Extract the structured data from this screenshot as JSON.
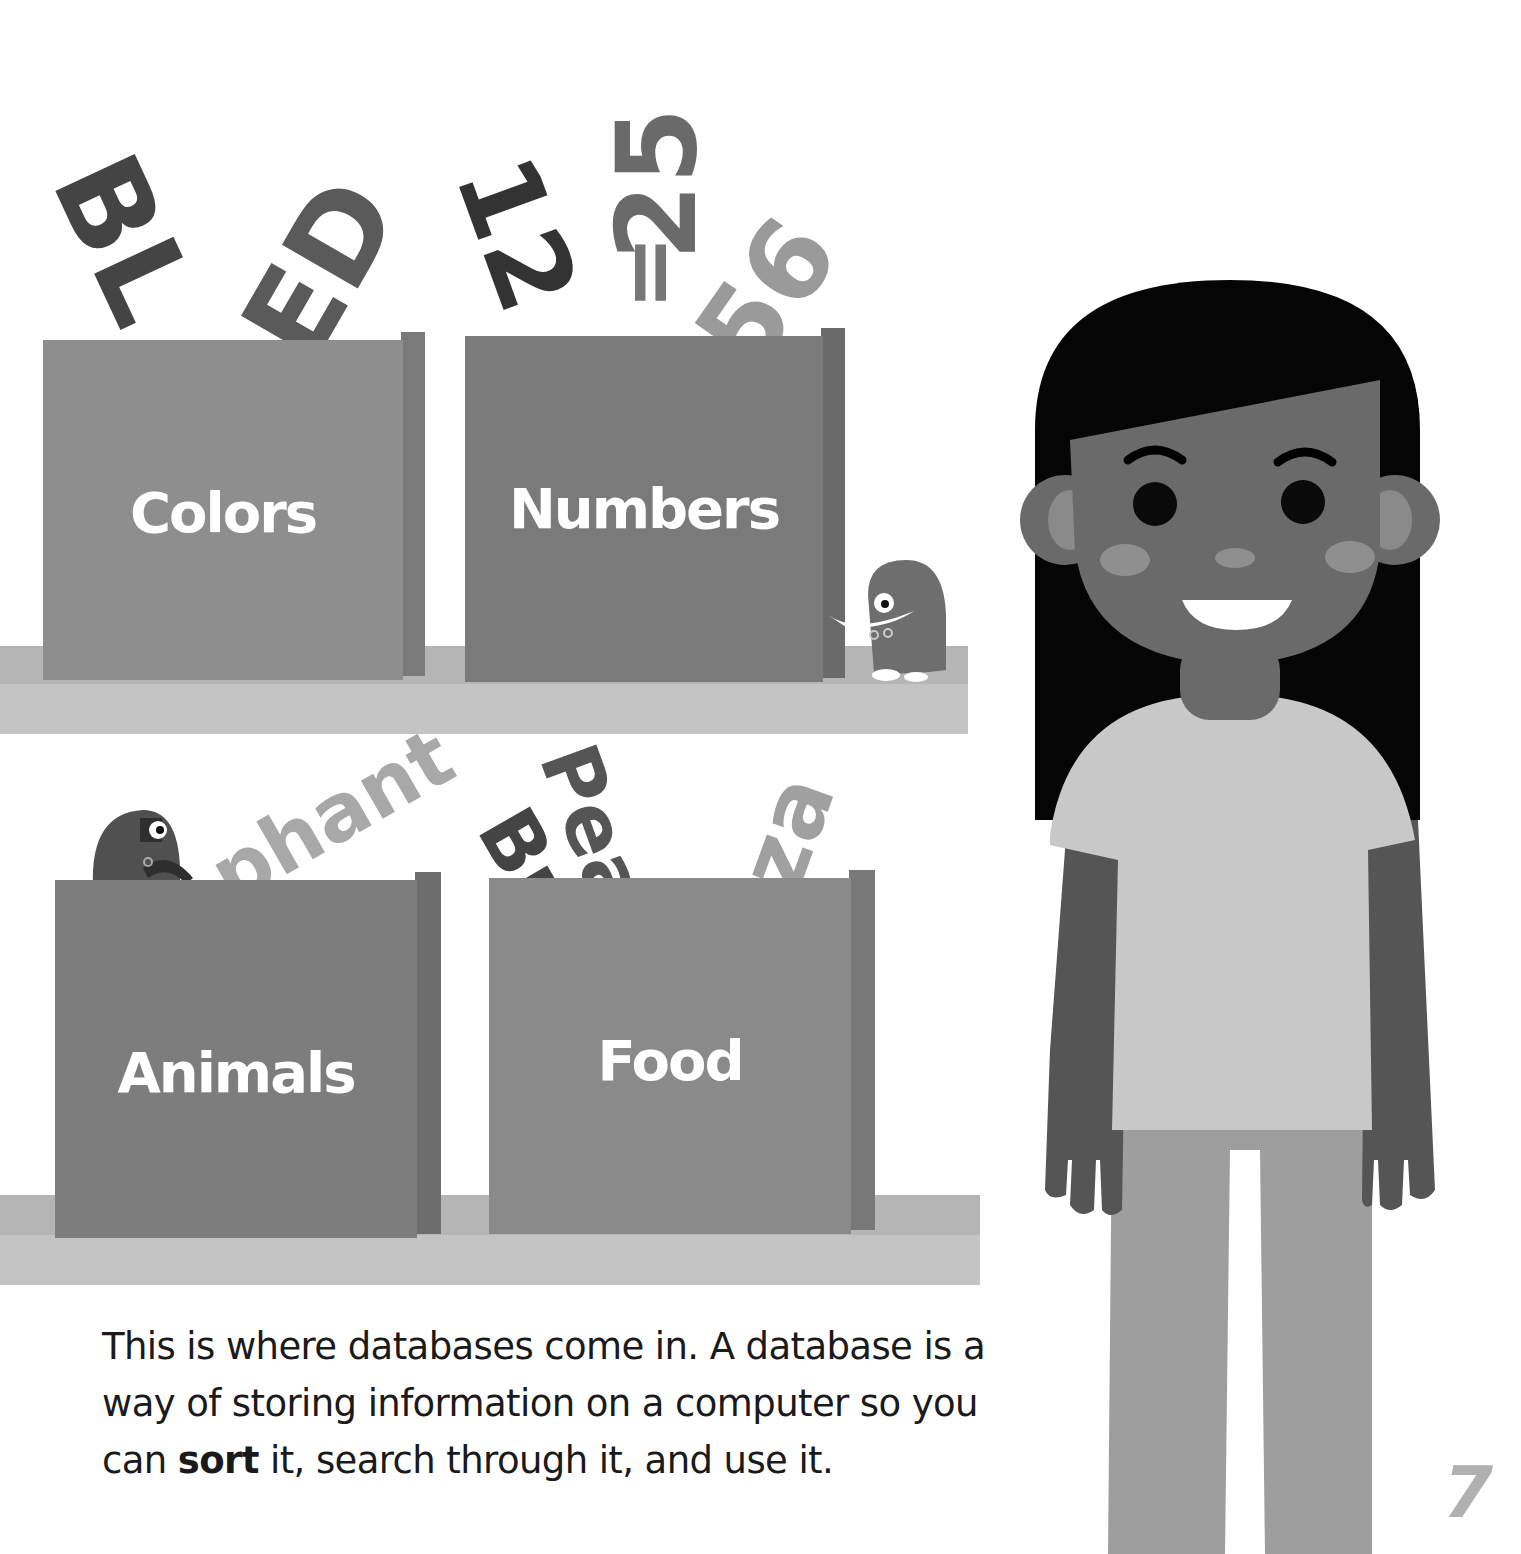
{
  "illustration": {
    "boxes": [
      {
        "label": "Colors",
        "color": "#8e8e8e",
        "side_color": "#7a7a7a"
      },
      {
        "label": "Numbers",
        "color": "#7a7a7a",
        "side_color": "#6a6a6a"
      },
      {
        "label": "Animals",
        "color": "#7d7d7d",
        "side_color": "#6d6d6d"
      },
      {
        "label": "Food",
        "color": "#8a8a8a",
        "side_color": "#787878"
      }
    ],
    "flying_text": {
      "colors": [
        "BL",
        "ED"
      ],
      "numbers": [
        "12",
        "25",
        "=",
        "56",
        "B"
      ],
      "animals": [
        "phant"
      ],
      "food": [
        "Pea",
        "Bu",
        "za"
      ]
    },
    "character": "girl",
    "monsters": [
      "monster-on-shelf",
      "monster-peeking"
    ]
  },
  "caption": {
    "part1": "This is where databases come in. A database is a way of storing information on a computer so you can ",
    "bold": "sort",
    "part2": " it, search through it, and use it."
  },
  "page_number": "7"
}
